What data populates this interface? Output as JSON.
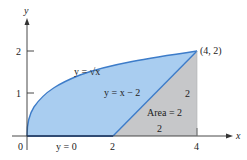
{
  "diagram": {
    "type": "region-between-curves",
    "axes": {
      "x_label": "x",
      "y_label": "y",
      "x_ticks": [
        "0",
        "2",
        "4"
      ],
      "y_ticks": [
        "1",
        "2"
      ]
    },
    "curves": [
      {
        "id": "sqrt",
        "label": "y = √x",
        "equation": "y = sqrt(x)"
      },
      {
        "id": "line",
        "label": "y = x − 2",
        "equation": "y = x - 2"
      },
      {
        "id": "xaxis",
        "label": "y = 0",
        "equation": "y = 0"
      }
    ],
    "point": {
      "label": "(4, 2)",
      "x": 4,
      "y": 2
    },
    "triangle": {
      "label": "Area = 2",
      "base_label": "2",
      "height_label": "2"
    },
    "colors": {
      "region_fill": "#a9cdf0",
      "curve_stroke": "#3d7cc9",
      "triangle_fill": "#c6c7c9",
      "axis": "#333333"
    }
  }
}
